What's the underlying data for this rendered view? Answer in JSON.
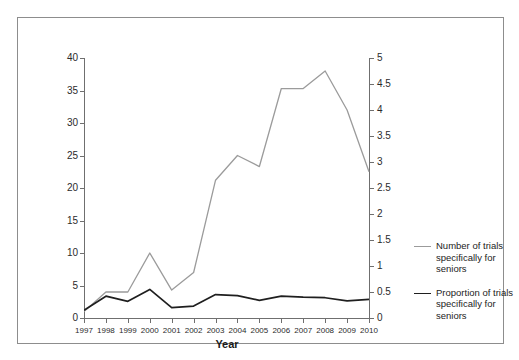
{
  "figure": {
    "border_color": "#8d8d8d",
    "background": "#ffffff"
  },
  "axes": {
    "left": {
      "title": "Number of trials",
      "ticks": [
        "0",
        "5",
        "10",
        "15",
        "20",
        "25",
        "30",
        "35",
        "40"
      ],
      "min": 0,
      "max": 40
    },
    "right": {
      "title": "Percentage of trials",
      "ticks": [
        "0",
        "0.5",
        "1",
        "1.5",
        "2",
        "2.5",
        "3",
        "3.5",
        "4",
        "4.5",
        "5"
      ],
      "min": 0,
      "max": 5
    },
    "x": {
      "title": "Year",
      "ticks": [
        "1997",
        "1998",
        "1999",
        "2000",
        "2001",
        "2002",
        "2003",
        "2004",
        "2005",
        "2006",
        "2007",
        "2008",
        "2009",
        "2010"
      ]
    }
  },
  "legend": {
    "entries": [
      {
        "label": "Number of trials specifically for seniors",
        "color": "#9b9b9b",
        "style": "gray"
      },
      {
        "label": "Proportion of trials specifically for seniors",
        "color": "#1f1f1f",
        "style": "black"
      }
    ]
  },
  "chart_data": {
    "type": "line",
    "title": "",
    "xlabel": "Year",
    "ylabel": "Number of trials",
    "ylabel_secondary": "Percentage of trials",
    "x": [
      "1997",
      "1998",
      "1999",
      "2000",
      "2001",
      "2002",
      "2003",
      "2004",
      "2005",
      "2006",
      "2007",
      "2008",
      "2009",
      "2010"
    ],
    "ylim": [
      0,
      40
    ],
    "ylim_secondary": [
      0,
      5
    ],
    "grid": false,
    "legend_position": "right",
    "series": [
      {
        "name": "Number of trials specifically for seniors",
        "axis": "left",
        "color": "#9b9b9b",
        "values": [
          1.0,
          4.0,
          4.0,
          10.0,
          4.3,
          7.0,
          21.2,
          25.0,
          23.3,
          35.3,
          35.3,
          38.0,
          32.0,
          22.5
        ]
      },
      {
        "name": "Proportion of trials specifically for seniors",
        "axis": "right",
        "color": "#1f1f1f",
        "values": [
          0.15,
          0.42,
          0.32,
          0.55,
          0.2,
          0.23,
          0.45,
          0.43,
          0.34,
          0.42,
          0.4,
          0.39,
          0.33,
          0.36
        ]
      }
    ]
  }
}
